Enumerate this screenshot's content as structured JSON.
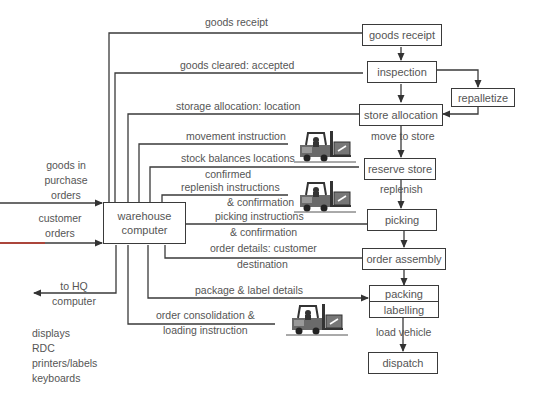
{
  "diagram": {
    "central": "warehouse computer",
    "process_boxes": {
      "goods_receipt": "goods receipt",
      "inspection": "inspection",
      "repalletize": "repalletize",
      "store_allocation": "store allocation",
      "reserve_store": "reserve store",
      "picking": "picking",
      "order_assembly": "order assembly",
      "packing": "packing",
      "labelling": "labelling",
      "dispatch": "dispatch"
    },
    "flow_labels": {
      "move_to_store": "move to store",
      "replenish": "replenish",
      "load_vehicle": "load vehicle"
    },
    "information_flows": {
      "goods_receipt": "goods receipt",
      "goods_cleared": "goods cleared: accepted",
      "storage_allocation": "storage allocation: location",
      "movement_instruction": "movement instruction",
      "stock_balances": "stock balances locations",
      "confirmed": "confirmed",
      "replenish_instructions": "replenish instructions",
      "replenish_confirmation": "& confirmation",
      "picking_instructions": "picking instructions",
      "picking_confirmation": "& confirmation",
      "order_details_1": "order details: customer",
      "order_details_2": "destination",
      "package_label": "package & label details",
      "order_consolidation_1": "order consolidation &",
      "order_consolidation_2": "loading instruction"
    },
    "inputs": {
      "goods_in_1": "goods in",
      "goods_in_2": "purchase",
      "goods_in_3": "orders",
      "customer_1": "customer",
      "customer_2": "orders"
    },
    "outputs": {
      "hq_1": "to HQ",
      "hq_2": "computer"
    },
    "peripherals": [
      "displays",
      "RDC",
      "printers/labels",
      "keyboards"
    ],
    "icons": [
      "forklift-icon",
      "forklift-icon",
      "forklift-icon"
    ],
    "colors": {
      "line": "#3a3a3a",
      "text": "#555555",
      "accent_red": "#c0392b"
    }
  }
}
